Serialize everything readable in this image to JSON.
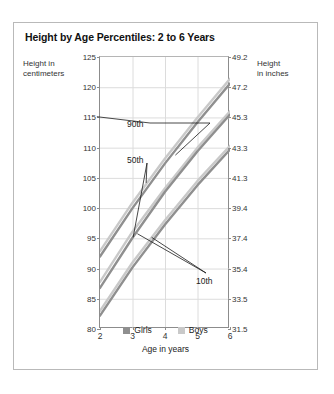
{
  "title": "Height by Age Percentiles: 2 to 6 Years",
  "axes": {
    "y_left_label_line1": "Height in",
    "y_left_label_line2": "centimeters",
    "y_right_label_line1": "Height",
    "y_right_label_line2": "in inches",
    "x_label": "Age in years"
  },
  "legend": {
    "items": [
      {
        "label": "Girls",
        "color": "#8f8f8f"
      },
      {
        "label": "Boys",
        "color": "#c9c9c9"
      }
    ]
  },
  "annotations": [
    {
      "label": "90th"
    },
    {
      "label": "50th"
    },
    {
      "label": "10th"
    }
  ],
  "chart_data": {
    "type": "line",
    "title": "Height by Age Percentiles: 2 to 6 Years",
    "xlabel": "Age in years",
    "ylabel": "Height in centimeters",
    "ylabel_secondary": "Height in inches",
    "xlim": [
      2,
      6
    ],
    "ylim": [
      80,
      125
    ],
    "ylim_secondary": [
      31.5,
      49.2
    ],
    "grid": true,
    "legend_position": "bottom",
    "x": [
      2,
      3,
      4,
      5,
      6
    ],
    "xticks": [
      2,
      3,
      4,
      5,
      6
    ],
    "yticks": [
      80,
      85,
      90,
      95,
      100,
      105,
      110,
      115,
      120,
      125
    ],
    "yticks_secondary": [
      31.5,
      33.5,
      35.4,
      37.4,
      39.4,
      41.3,
      43.3,
      45.3,
      47.2,
      49.2
    ],
    "series": [
      {
        "name": "Boys 90th",
        "percentile": "90th",
        "sex": "Boys",
        "color": "#c9c9c9",
        "values": [
          92.9,
          100.9,
          108.2,
          115.0,
          121.4
        ]
      },
      {
        "name": "Girls 90th",
        "percentile": "90th",
        "sex": "Girls",
        "color": "#8f8f8f",
        "values": [
          92.0,
          100.0,
          107.4,
          114.2,
          120.6
        ]
      },
      {
        "name": "Boys 50th",
        "percentile": "50th",
        "sex": "Boys",
        "color": "#c9c9c9",
        "values": [
          87.8,
          96.1,
          103.3,
          110.0,
          116.0
        ]
      },
      {
        "name": "Girls 50th",
        "percentile": "50th",
        "sex": "Girls",
        "color": "#8f8f8f",
        "values": [
          86.8,
          95.1,
          102.7,
          109.4,
          115.5
        ]
      },
      {
        "name": "Boys 10th",
        "percentile": "10th",
        "sex": "Boys",
        "color": "#c9c9c9",
        "values": [
          83.0,
          91.0,
          98.0,
          104.5,
          110.3
        ]
      },
      {
        "name": "Girls 10th",
        "percentile": "10th",
        "sex": "Girls",
        "color": "#8f8f8f",
        "values": [
          82.2,
          90.2,
          97.3,
          103.8,
          109.7
        ]
      }
    ]
  }
}
